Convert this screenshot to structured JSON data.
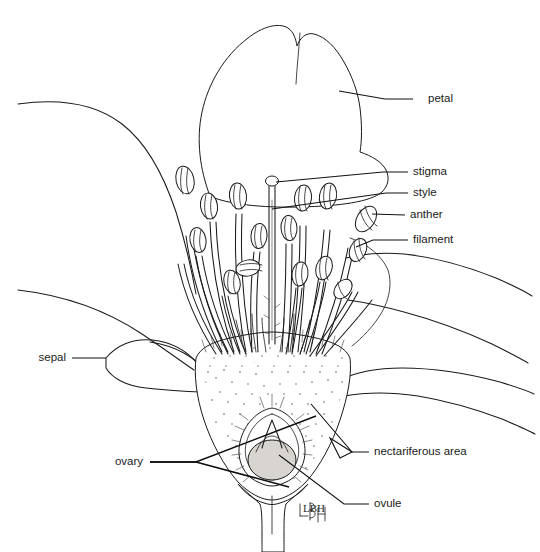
{
  "figure": {
    "style": "black and white line drawing with stipple shading",
    "background_color": "#ffffff",
    "ink_color": "#1a1a1a",
    "width": 540,
    "height": 552
  },
  "labels": [
    {
      "id": "petal",
      "text": "petal",
      "side": "right",
      "text_x": 428,
      "text_y": 99,
      "leader": [
        [
          413,
          99
        ],
        [
          385,
          99
        ],
        [
          339,
          91
        ]
      ],
      "target_part": "upper-petal"
    },
    {
      "id": "stigma",
      "text": "stigma",
      "side": "right",
      "text_x": 413,
      "text_y": 172,
      "leader": [
        [
          408,
          172
        ],
        [
          383,
          172
        ],
        [
          276,
          182
        ]
      ],
      "target_part": "stigma-knob"
    },
    {
      "id": "style",
      "text": "style",
      "side": "right",
      "text_x": 413,
      "text_y": 193,
      "leader": [
        [
          408,
          193
        ],
        [
          386,
          193
        ],
        [
          272,
          209
        ]
      ],
      "target_part": "style-shaft"
    },
    {
      "id": "anther",
      "text": "anther",
      "side": "right",
      "text_x": 410,
      "text_y": 215,
      "leader": [
        [
          405,
          215
        ],
        [
          372,
          214
        ]
      ],
      "target_part": "anther-head"
    },
    {
      "id": "filament",
      "text": "filament",
      "side": "right",
      "text_x": 413,
      "text_y": 240,
      "leader": [
        [
          408,
          240
        ],
        [
          373,
          240
        ],
        [
          356,
          247
        ]
      ],
      "target_part": "filament-stalk"
    },
    {
      "id": "sepal",
      "text": "sepal",
      "side": "left",
      "text_x": 66,
      "text_y": 358,
      "leader": [
        [
          72,
          358
        ],
        [
          106,
          358
        ]
      ],
      "target_part": "sepal-lobe"
    },
    {
      "id": "ovary",
      "text": "ovary",
      "side": "left",
      "text_x": 143,
      "text_y": 462,
      "leader_multi": [
        [
          [
            150,
            462
          ],
          [
            196,
            462
          ],
          [
            316,
            416
          ]
        ],
        [
          [
            150,
            462
          ],
          [
            196,
            462
          ],
          [
            289,
            487
          ]
        ]
      ],
      "target_part": "ovary-wall"
    },
    {
      "id": "nectariferous-area",
      "text": "nectariferous area",
      "side": "right",
      "text_x": 374,
      "text_y": 452,
      "leader": [
        [
          369,
          452
        ],
        [
          352,
          452
        ],
        [
          311,
          404
        ]
      ],
      "target_part": "nectary"
    },
    {
      "id": "ovule",
      "text": "ovule",
      "side": "right",
      "text_x": 374,
      "text_y": 504,
      "leader": [
        [
          369,
          504
        ],
        [
          344,
          504
        ],
        [
          279,
          455
        ]
      ],
      "target_part": "ovule-body"
    }
  ],
  "parts": {
    "petal": "petal",
    "stigma": "stigma",
    "style": "style",
    "anther": "anther",
    "filament": "filament",
    "sepal": "sepal",
    "ovary": "ovary",
    "nectariferous_area": "nectariferous area",
    "ovule": "ovule"
  },
  "signature": {
    "monogram": "LBH"
  },
  "colors": {
    "ink": "#1a1a1a",
    "leader": "#111111",
    "ovule_shade": "#d8d4d0",
    "stipple": "#4a4a4a",
    "background": "#ffffff"
  }
}
